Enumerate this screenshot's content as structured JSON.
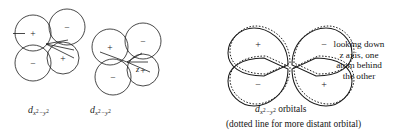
{
  "figure": {
    "kind": "orbital-overlap-diagram",
    "stroke_color": "#1a1a1a",
    "background": "#ffffff"
  },
  "left_diagram": {
    "name": "two-dx2-y2-orbitals-perspective",
    "axis_labels": [
      {
        "id": "z",
        "text": "z"
      }
    ],
    "lobes": [
      {
        "id": "a-top-left",
        "sign": "+"
      },
      {
        "id": "a-top-right",
        "sign": "−"
      },
      {
        "id": "a-bottom-left",
        "sign": "−"
      },
      {
        "id": "a-bottom-right",
        "sign": "+"
      },
      {
        "id": "b-top-left",
        "sign": "+"
      },
      {
        "id": "b-top-right",
        "sign": "−"
      },
      {
        "id": "b-bottom-left",
        "sign": "−"
      },
      {
        "id": "b-bottom-right",
        "sign": "+"
      }
    ],
    "labels": [
      {
        "id": "orbital-label-left",
        "symbol": "d",
        "sub_base_1": "x",
        "sub_sup_1": "2",
        "sub_minus": "−",
        "sub_base_2": "y",
        "sub_sup_2": "2"
      },
      {
        "id": "orbital-label-right",
        "symbol": "d",
        "sub_base_1": "x",
        "sub_sup_1": "2",
        "sub_minus": "−",
        "sub_base_2": "y",
        "sub_sup_2": "2"
      }
    ]
  },
  "right_diagram": {
    "name": "dx2-y2-cloverleaf-down-z-axis",
    "lobes": [
      {
        "id": "top-left",
        "sign": "+"
      },
      {
        "id": "top-right",
        "sign": "−"
      },
      {
        "id": "bottom-left",
        "sign": "−"
      },
      {
        "id": "bottom-right",
        "sign": "+"
      }
    ],
    "side_note_lines": [
      "looking down",
      "z axis, one",
      "atom behind",
      "the other"
    ],
    "orbital_caption": {
      "symbol": "d",
      "sub_base_1": "x",
      "sub_sup_1": "2",
      "sub_minus": "−",
      "sub_base_2": "y",
      "sub_sup_2": "2",
      "trailing": " orbitals"
    },
    "dotted_note": "(dotted line for more distant orbital)"
  }
}
